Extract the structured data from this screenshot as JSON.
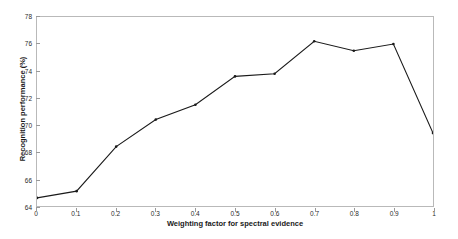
{
  "chart_data": {
    "type": "line",
    "title": "",
    "xlabel": "Weighting factor for spectral evidence",
    "ylabel": "Recognition performance (%)",
    "xlim": [
      0,
      1
    ],
    "ylim": [
      64,
      78
    ],
    "grid": false,
    "legend": "none",
    "line_color": "#1a1a1a",
    "marker": "dot",
    "x": [
      0,
      0.1,
      0.2,
      0.3,
      0.4,
      0.5,
      0.6,
      0.7,
      0.8,
      0.9,
      1
    ],
    "values": [
      64.6,
      65.1,
      68.4,
      70.4,
      71.5,
      73.6,
      73.8,
      76.2,
      75.5,
      76.0,
      69.4
    ],
    "xticks": [
      "0",
      "0.1",
      "0.2",
      "0.3",
      "0.4",
      "0.5",
      "0.6",
      "0.7",
      "0.8",
      "0.9",
      "1"
    ],
    "yticks": [
      "64",
      "66",
      "68",
      "70",
      "72",
      "74",
      "76",
      "78"
    ],
    "xtick_values": [
      0,
      0.1,
      0.2,
      0.3,
      0.4,
      0.5,
      0.6,
      0.7,
      0.8,
      0.9,
      1
    ],
    "ytick_values": [
      64,
      66,
      68,
      70,
      72,
      74,
      76,
      78
    ]
  }
}
